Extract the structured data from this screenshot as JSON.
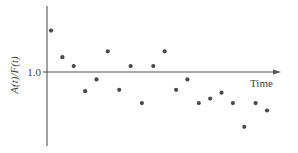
{
  "chart_data": {
    "type": "scatter",
    "title": "",
    "xlabel": "Time",
    "ylabel": "A(t)/F(t)",
    "y_ticks": [
      {
        "value": 1.0,
        "label": "1.0"
      }
    ],
    "x_ticks": [],
    "grid": false,
    "legend": null,
    "reference_line": {
      "y": 1.0,
      "note": "x-axis drawn at y = 1.0 with arrow pointing right"
    },
    "ylim": [
      0.55,
      1.5
    ],
    "xlim": [
      0,
      21
    ],
    "series": [
      {
        "name": "A(t)/F(t)",
        "color": "#4a4a4a",
        "x": [
          1,
          2,
          3,
          4,
          5,
          6,
          7,
          8,
          9,
          10,
          11,
          12,
          13,
          14,
          15,
          16,
          17,
          18,
          19,
          20
        ],
        "y": [
          1.28,
          1.1,
          1.04,
          0.87,
          0.95,
          1.14,
          0.88,
          1.04,
          0.79,
          1.04,
          1.14,
          0.88,
          0.95,
          0.79,
          0.82,
          0.86,
          0.79,
          0.63,
          0.79,
          0.74
        ]
      }
    ]
  },
  "labels": {
    "ylabel": "A(t)/F(t)",
    "xlabel": "Time",
    "ytick": "1.0"
  },
  "colors": {
    "axis": "#555555",
    "points": "#4a4a4a",
    "text": "#444444",
    "background": "#ffffff"
  }
}
